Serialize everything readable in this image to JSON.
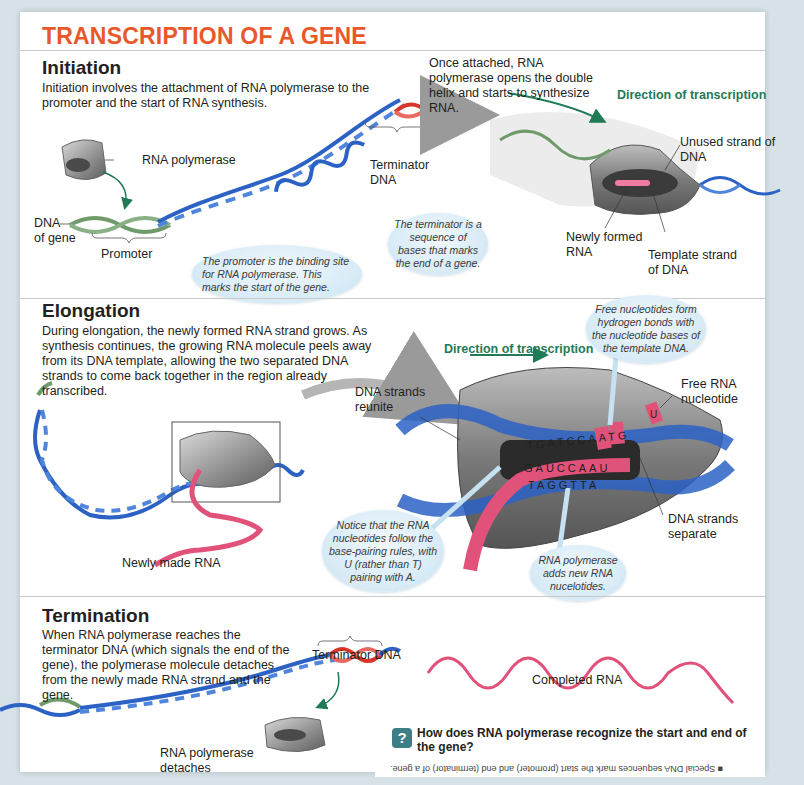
{
  "title": "TRANSCRIPTION OF A GENE",
  "initiation": {
    "heading": "Initiation",
    "description": "Initiation involves the attachment of RNA polymerase to the promoter and the start of RNA synthesis.",
    "labels": {
      "rna_polymerase": "RNA polymerase",
      "dna_of_gene_1": "DNA",
      "dna_of_gene_2": "of gene",
      "promoter": "Promoter",
      "terminator_dna_1": "Terminator",
      "terminator_dna_2": "DNA",
      "once_attached": "Once attached, RNA polymerase opens the double helix and starts to synthesize RNA.",
      "direction": "Direction of transcription",
      "unused_strand": "Unused strand of DNA",
      "newly_formed_rna": "Newly formed RNA",
      "template_strand": "Template strand of DNA"
    },
    "bubbles": {
      "promoter": "The promoter is the binding site for RNA polymerase. This marks the start of the gene.",
      "terminator": "The terminator is a sequence of bases that marks the end of a gene."
    }
  },
  "elongation": {
    "heading": "Elongation",
    "description": "During elongation, the newly formed RNA strand grows. As synthesis continues, the growing RNA molecule peels away from its DNA template, allowing the two separated DNA strands to come back together in the region already transcribed.",
    "labels": {
      "direction": "Direction of transcription",
      "dna_strands_reunite": "DNA strands reunite",
      "free_rna_nucleotide": "Free RNA nucleotide",
      "dna_strands_separate": "DNA strands separate",
      "newly_made_rna": "Newly made RNA"
    },
    "sequences": {
      "top_strand": "TGATCCAATG",
      "rna_strand": "GAUCCAAU",
      "template_strand": "TAGGTTA",
      "free_nucleotide": "U"
    },
    "bubbles": {
      "free_nucleotides": "Free nucleotides form hydrogen bonds with the nucleotide bases of the template DNA.",
      "base_pairing": "Notice that the RNA nucleotides follow the base-pairing rules, with U (rather than T) pairing with A.",
      "adds_new": "RNA polymerase adds new RNA nucelotides."
    }
  },
  "termination": {
    "heading": "Termination",
    "description": "When RNA polymerase reaches the terminator DNA (which signals the end of the gene), the polymerase molecule detaches from the newly made RNA strand and the gene.",
    "labels": {
      "terminator_dna": "Terminator DNA",
      "completed_rna": "Completed RNA",
      "rna_polymerase_detaches_1": "RNA polymerase",
      "rna_polymerase_detaches_2": "detaches"
    }
  },
  "question": {
    "icon": "?",
    "text": "How does RNA polymerase recognize the start and end of the gene?",
    "answer": "■ Special DNA sequences mark the start (promoter) and end (terminator) of a gene."
  },
  "colors": {
    "title": "#e8582a",
    "dna_blue": "#2b62c4",
    "promoter_green": "#6f9a6a",
    "terminator_red": "#d9362b",
    "rna_pink": "#e0527a",
    "direction_green": "#1f7a55",
    "polymerase_gray": "#8c8c8c",
    "question_icon": "#3d7e87"
  }
}
